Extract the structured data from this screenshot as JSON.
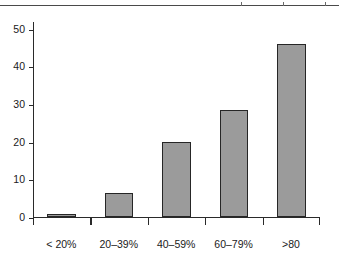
{
  "figure": {
    "name": "bar-chart-figure",
    "top_remnant_note": "cropped axis line from adjacent figure"
  },
  "chart_data": {
    "type": "bar",
    "title": "",
    "subtitle": "",
    "xlabel": "",
    "ylabel": "",
    "categories": [
      "< 20%",
      "20–39%",
      "40–59%",
      "60–79%",
      ">80"
    ],
    "values": [
      0.8,
      6.5,
      20,
      28.5,
      46
    ],
    "ylim": [
      0,
      52
    ],
    "yticks": [
      0,
      10,
      20,
      30,
      40,
      50
    ],
    "ytick_labels": [
      "0",
      "10",
      "20",
      "30",
      "40",
      "50"
    ],
    "grid": false,
    "legend": null,
    "legend_position": "none",
    "annotations": [],
    "bar_fill_color": "#9b9b9b",
    "bar_edge_color": "#262626",
    "axis_color": "#2a2a2a",
    "background_color": "#ffffff"
  }
}
